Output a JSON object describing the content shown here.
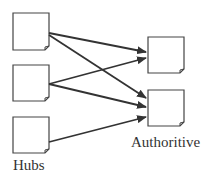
{
  "diagram": {
    "labels": {
      "hubs": "Hubs",
      "authoritive": "Authoritive"
    },
    "nodes": {
      "hubs": [
        {
          "id": "hub-1",
          "x": 13,
          "y": 13,
          "w": 36,
          "h": 37
        },
        {
          "id": "hub-2",
          "x": 13,
          "y": 65,
          "w": 36,
          "h": 36
        },
        {
          "id": "hub-3",
          "x": 13,
          "y": 117,
          "w": 36,
          "h": 36
        }
      ],
      "authorities": [
        {
          "id": "auth-1",
          "x": 148,
          "y": 37,
          "w": 36,
          "h": 36
        },
        {
          "id": "auth-2",
          "x": 148,
          "y": 90,
          "w": 36,
          "h": 36
        }
      ]
    },
    "edges": [
      {
        "from": "hub-1",
        "to": "auth-1"
      },
      {
        "from": "hub-1",
        "to": "auth-2"
      },
      {
        "from": "hub-2",
        "to": "auth-1"
      },
      {
        "from": "hub-2",
        "to": "auth-2"
      },
      {
        "from": "hub-3",
        "to": "auth-2"
      }
    ],
    "colors": {
      "stroke": "#333333",
      "background": "#ffffff"
    }
  }
}
